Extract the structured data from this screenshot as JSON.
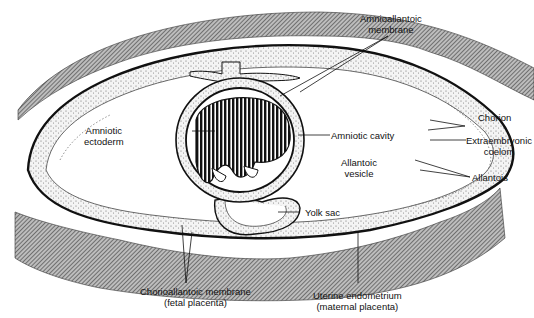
{
  "diagram": {
    "labels": {
      "amnioallantoic_membrane": [
        "Amnioallantoic",
        "membrane"
      ],
      "chorion": [
        "Chorion"
      ],
      "extraembryonic_coelom": [
        "Extraembryonic",
        "coelom"
      ],
      "allantois": [
        "Allantois"
      ],
      "amniotic_ectoderm": [
        "Amniotic",
        "ectoderm"
      ],
      "amniotic_cavity": [
        "Amniotic cavity"
      ],
      "allantoic_vesicle": [
        "Allantoic",
        "vesicle"
      ],
      "yolk_sac": [
        "Yolk sac"
      ],
      "chorioallantoic_membrane": [
        "Chorioallantoic membrane",
        "(fetal placenta)"
      ],
      "uterine_endometrium": [
        "Uterine endometrium",
        "(maternal placenta)"
      ]
    },
    "colors": {
      "line": "#111111",
      "hatch": "#555555",
      "stipple": "#888888",
      "background": "#ffffff"
    }
  }
}
